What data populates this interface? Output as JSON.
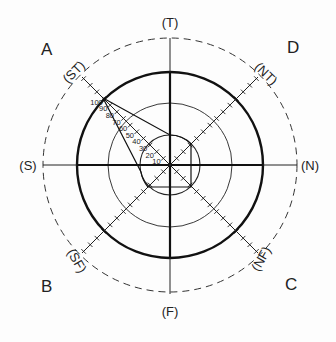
{
  "diagram": {
    "type": "polar-zone-diagram",
    "quadrant_labels": {
      "top_left": "A",
      "top_right": "D",
      "bottom_left": "B",
      "bottom_right": "C"
    },
    "axis_labels": {
      "top": "(T)",
      "bottom": "(F)",
      "left": "(S)",
      "right": "(N)",
      "diag_top_left": "(ST)",
      "diag_top_right": "(NT)",
      "diag_bottom_left": "(SF)",
      "diag_bottom_right": "(NF)"
    },
    "scale_labels": [
      "10",
      "20",
      "30",
      "40",
      "50",
      "60",
      "70",
      "80",
      "90",
      "100"
    ],
    "circles": [
      {
        "name": "inner",
        "style": "solid-medium"
      },
      {
        "name": "middle",
        "style": "solid-thin"
      },
      {
        "name": "outer",
        "style": "solid-thick"
      },
      {
        "name": "boundary",
        "style": "dashed"
      }
    ],
    "colors": {
      "ink": "#1a1a1a",
      "background": "#fdfdfd"
    }
  }
}
